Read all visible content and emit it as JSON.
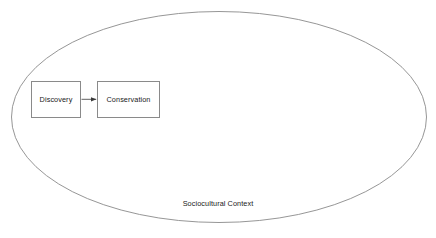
{
  "diagram": {
    "type": "concept-diagram",
    "background_color": "#ffffff",
    "stroke_color": "#8a8a8a",
    "text_color": "#1a1a1a",
    "container": {
      "shape": "ellipse",
      "label": "Sociocultural Context",
      "center_x": 219,
      "center_y": 117,
      "radius_x": 208,
      "radius_y": 105
    },
    "nodes": [
      {
        "id": "discovery",
        "label": "Discovery",
        "shape": "rectangle",
        "x": 31,
        "y": 81,
        "width": 50,
        "height": 37
      },
      {
        "id": "conservation",
        "label": "Conservation",
        "shape": "rectangle",
        "x": 97,
        "y": 81,
        "width": 63,
        "height": 37
      }
    ],
    "edges": [
      {
        "id": "discovery-to-conservation",
        "from": "discovery",
        "to": "conservation",
        "label": "",
        "arrowhead": "filled-triangle",
        "direction": "right"
      }
    ]
  }
}
